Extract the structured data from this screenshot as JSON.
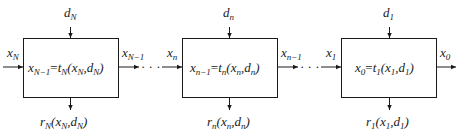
{
  "stages": [
    {
      "id": "stage-N",
      "decision": {
        "base": "d",
        "sub": "N"
      },
      "input": {
        "base": "x",
        "sub": "N"
      },
      "output": {
        "base": "x",
        "sub": "N−1"
      },
      "transform": {
        "lhs": "x",
        "lhs_sub": "N−1",
        "fn": "t",
        "fn_sub": "N",
        "args": "(x",
        "a1_sub": "N",
        "mid": ",d",
        "a2_sub": "N",
        "end": ")"
      },
      "return": {
        "fn": "r",
        "fn_sub": "N",
        "args": "(x",
        "a1_sub": "N",
        "mid": ",d",
        "a2_sub": "N",
        "end": ")"
      }
    },
    {
      "id": "stage-n",
      "decision": {
        "base": "d",
        "sub": "n"
      },
      "input": {
        "base": "x",
        "sub": "n"
      },
      "output": {
        "base": "x",
        "sub": "n−1"
      },
      "transform": {
        "lhs": "x",
        "lhs_sub": "n−1",
        "fn": "t",
        "fn_sub": "n",
        "args": "(x",
        "a1_sub": "n",
        "mid": ",d",
        "a2_sub": "n",
        "end": ")"
      },
      "return": {
        "fn": "r",
        "fn_sub": "n",
        "args": "(x",
        "a1_sub": "n",
        "mid": ",d",
        "a2_sub": "n",
        "end": ")"
      }
    },
    {
      "id": "stage-1",
      "decision": {
        "base": "d",
        "sub": "1"
      },
      "input": {
        "base": "x",
        "sub": "1"
      },
      "output": {
        "base": "x",
        "sub": "0"
      },
      "transform": {
        "lhs": "x",
        "lhs_sub": "0",
        "fn": "t",
        "fn_sub": "1",
        "args": "(x",
        "a1_sub": "1",
        "mid": ",d",
        "a2_sub": "1",
        "end": ")"
      },
      "return": {
        "fn": "r",
        "fn_sub": "1",
        "args": "(x",
        "a1_sub": "1",
        "mid": ",d",
        "a2_sub": "1",
        "end": ")"
      }
    }
  ],
  "ellipsis": "· · ·",
  "equals": "="
}
